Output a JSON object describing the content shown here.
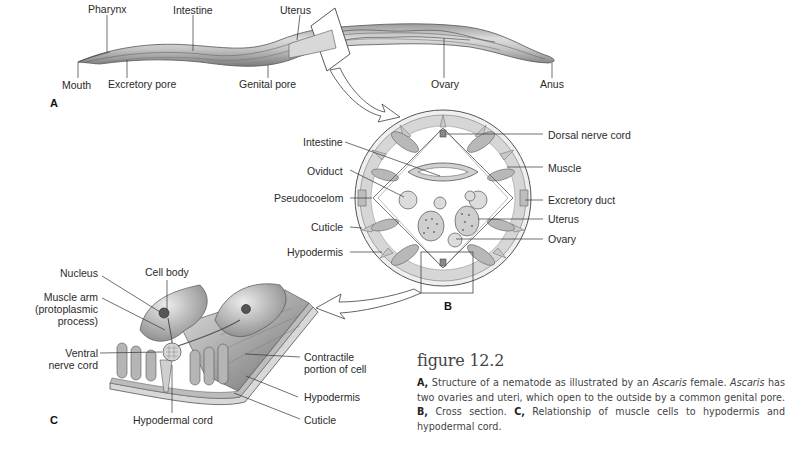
{
  "figure": {
    "title": "figure 12.2",
    "caption": {
      "a_key": "A,",
      "a_text_1": " Structure of a nematode as illustrated by an ",
      "genus": "Ascaris",
      "a_text_2": " female. ",
      "genus_2": "Ascaris",
      "a_text_3": " has two ovaries and uteri, which open to the outside by a common genital pore. ",
      "b_key": "B,",
      "b_text": " Cross section. ",
      "c_key": "C,",
      "c_text": " Relationship of muscle cells to hypodermis and hypodermal cord."
    }
  },
  "panel_a": {
    "letter": "A",
    "labels": {
      "pharynx": "Pharynx",
      "intestine": "Intestine",
      "uterus": "Uterus",
      "mouth": "Mouth",
      "excretory_pore": "Excretory pore",
      "genital_pore": "Genital pore",
      "ovary": "Ovary",
      "anus": "Anus"
    }
  },
  "panel_b": {
    "letter": "B",
    "labels": {
      "intestine": "Intestine",
      "oviduct": "Oviduct",
      "pseudocoelom": "Pseudocoelom",
      "cuticle": "Cuticle",
      "hypodermis": "Hypodermis",
      "dorsal_nerve_cord": "Dorsal nerve cord",
      "muscle": "Muscle",
      "excretory_duct": "Excretory duct",
      "uterus": "Uterus",
      "ovary": "Ovary"
    }
  },
  "panel_c": {
    "letter": "C",
    "labels": {
      "nucleus": "Nucleus",
      "cell_body": "Cell body",
      "muscle_arm_1": "Muscle arm",
      "muscle_arm_2": "(protoplasmic",
      "muscle_arm_3": "process)",
      "ventral_1": "Ventral",
      "ventral_2": "nerve cord",
      "hypodermal_cord": "Hypodermal cord",
      "contractile_1": "Contractile",
      "contractile_2": "portion of cell",
      "hypodermis": "Hypodermis",
      "cuticle": "Cuticle"
    }
  }
}
